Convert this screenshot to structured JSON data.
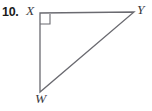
{
  "figure": {
    "problem_number": "10.",
    "type": "right-triangle-diagram",
    "background_color": "#ffffff",
    "stroke_color": "#6a6a70",
    "stroke_width": 1.3,
    "label_color": "#3a3a3e",
    "number_color": "#1b1b1b",
    "canvas": {
      "width": 152,
      "height": 111
    },
    "vertices": [
      {
        "name": "X",
        "label": "X",
        "x": 40,
        "y": 13,
        "label_x": 26,
        "label_y": 4,
        "right_angle": true
      },
      {
        "name": "Y",
        "label": "Y",
        "x": 134,
        "y": 12,
        "label_x": 137,
        "label_y": 3,
        "right_angle": false
      },
      {
        "name": "W",
        "label": "W",
        "x": 40,
        "y": 92,
        "label_x": 35,
        "label_y": 92,
        "right_angle": false
      }
    ],
    "sides": [
      {
        "name": "XY",
        "from": "X",
        "to": "Y",
        "role": "leg"
      },
      {
        "name": "XW",
        "from": "X",
        "to": "W",
        "role": "leg"
      },
      {
        "name": "WY",
        "from": "W",
        "to": "Y",
        "role": "hypotenuse"
      }
    ],
    "right_angle_marker": {
      "at_vertex": "X",
      "size": 10,
      "corner_x": 40,
      "corner_y": 13
    },
    "path_outline": "M 40 13 L 134 12 L 40 92 Z",
    "path_right_angle": "M 40 24 L 50 24 L 50 14"
  }
}
